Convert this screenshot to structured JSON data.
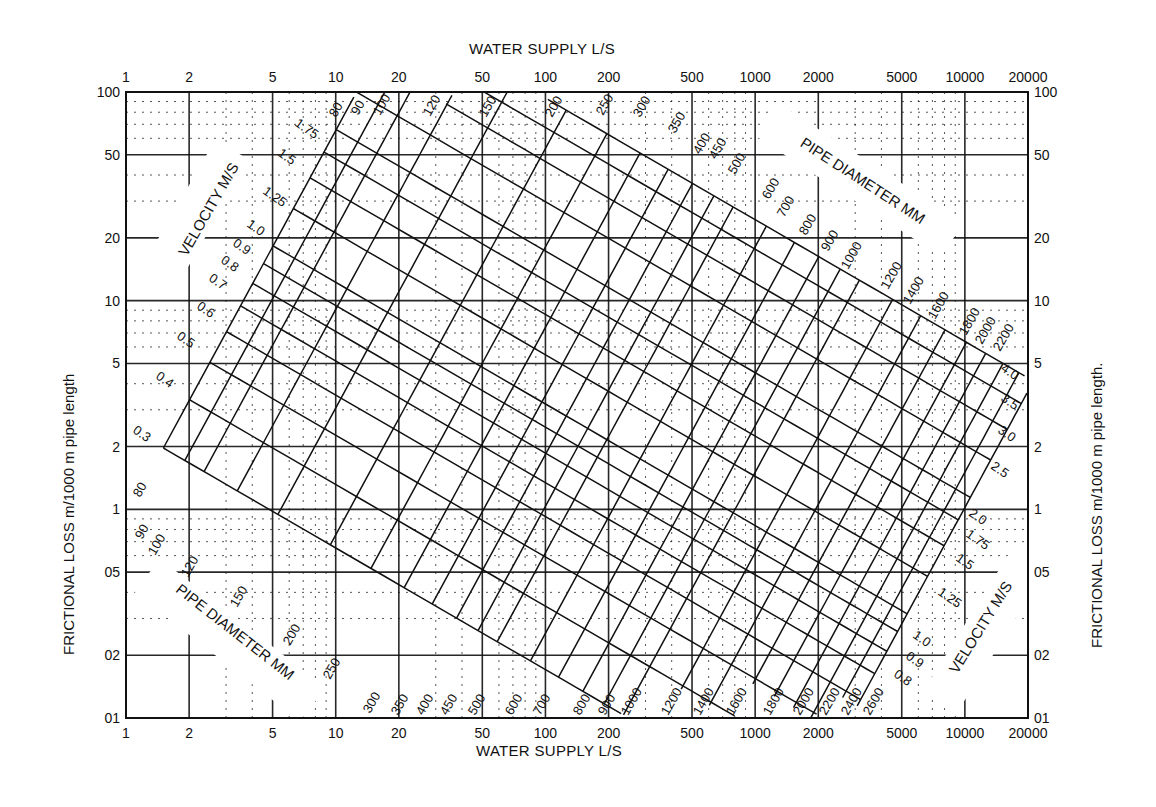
{
  "chart_data": {
    "type": "line",
    "xlabel": "WATER SUPPLY L/S",
    "ylabel_left": "FRICTIONAL LOSS m/1000 m  pipe length",
    "ylabel_right": "FRICTIONAL LOSS   m/1000 m pipe length.",
    "xscale": "log",
    "yscale": "log",
    "xlim": [
      1,
      20000
    ],
    "ylim": [
      0.1,
      100
    ],
    "grid": true,
    "x_ticks": [
      1,
      2,
      5,
      10,
      20,
      50,
      100,
      200,
      500,
      1000,
      2000,
      5000,
      10000,
      20000
    ],
    "x_tick_labels": [
      "1",
      "2",
      "5",
      "10",
      "20",
      "50",
      "100",
      "200",
      "500",
      "1000",
      "2000",
      "5000",
      "10000",
      "20000"
    ],
    "y_ticks": [
      100,
      50,
      20,
      10,
      5,
      2,
      1,
      0.5,
      0.2,
      0.1
    ],
    "y_tick_labels": [
      "100",
      "50",
      "20",
      "10",
      "5",
      "2",
      "1",
      "0.5",
      "0.2",
      "0.1"
    ],
    "series_families": [
      {
        "name": "PIPE DIAMETER MM",
        "orientation": "rising",
        "values": [
          80,
          90,
          100,
          120,
          150,
          200,
          250,
          300,
          350,
          400,
          450,
          500,
          600,
          700,
          800,
          900,
          1000,
          1200,
          1400,
          1600,
          1800,
          2000,
          2200,
          2400,
          2600
        ]
      },
      {
        "name": "VELOCITY M/S",
        "orientation": "falling",
        "values": [
          0.3,
          0.4,
          0.5,
          0.6,
          0.7,
          0.8,
          0.9,
          1.0,
          1.25,
          1.5,
          1.75,
          2.0,
          2.5,
          3.0,
          3.5,
          4.0
        ]
      }
    ],
    "annotations": [
      "VELOCITY M/S (upper left)",
      "PIPE DIAMETER MM (upper right)",
      "PIPE DIAMETER MM (lower left)",
      "VELOCITY M/S (lower right)"
    ],
    "velocity_labels_left": [
      "0.3",
      "0.4",
      "0.5",
      "0.6",
      "0.7",
      "0.8",
      "0.9",
      "1.0",
      "1.25",
      "1.5",
      "1.75"
    ],
    "velocity_labels_right": [
      "0.8",
      "0.9",
      "1.0",
      "1.25",
      "1.5",
      "1.75",
      "2.0",
      "2.5",
      "3.0",
      "3.5",
      "4.0"
    ],
    "diameter_labels_top": [
      "80",
      "90",
      "100",
      "120",
      "150",
      "200",
      "250",
      "300",
      "350",
      "400",
      "450",
      "500",
      "600",
      "700",
      "800",
      "900",
      "1000",
      "1200",
      "1400",
      "1600",
      "1800",
      "2000",
      "2200"
    ],
    "diameter_labels_bottom": [
      "80",
      "90",
      "100",
      "120",
      "150",
      "200",
      "250",
      "300",
      "350",
      "400",
      "450",
      "500",
      "600",
      "700",
      "800",
      "900",
      "1000",
      "1200",
      "1400",
      "1600",
      "1800",
      "2000",
      "2200",
      "2400",
      "2600"
    ]
  },
  "labels": {
    "x_top": "WATER SUPPLY L/S",
    "x_bottom": "WATER SUPPLY L/S",
    "y_left": "FRICTIONAL LOSS m/1000 m  pipe length",
    "y_right": "FRICTIONAL LOSS   m/1000 m pipe length.",
    "velocity_ul": "VELOCITY M/S",
    "velocity_lr": "VELOCITY M/S",
    "diameter_ur": "PIPE DIAMETER MM",
    "diameter_ll": "PIPE DIAMETER MM"
  },
  "y_tick_display": [
    "100",
    "50",
    "20",
    "10",
    "5",
    "2",
    "1",
    "05",
    "02",
    "01"
  ],
  "colors": {
    "ink": "#111111",
    "paper": "#ffffff"
  }
}
